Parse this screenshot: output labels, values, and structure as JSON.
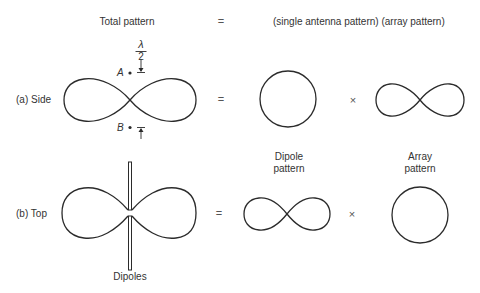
{
  "header": {
    "total_pattern": "Total pattern",
    "equals": "=",
    "rhs": "(single antenna pattern) (array pattern)"
  },
  "row_side": {
    "label": "(a) Side",
    "equals": "=",
    "times": "×",
    "annotation": {
      "lambda": "λ",
      "two": "2",
      "point_a": "A",
      "point_b": "B"
    },
    "shapes": {
      "total": "figure-eight",
      "single_antenna": "circle",
      "array": "figure-eight"
    }
  },
  "row_top": {
    "label": "(b) Top",
    "equals": "=",
    "times": "×",
    "dipole_pattern_line1": "Dipole",
    "dipole_pattern_line2": "pattern",
    "array_pattern_line1": "Array",
    "array_pattern_line2": "pattern",
    "dipoles_label": "Dipoles",
    "shapes": {
      "total": "figure-eight with dipole rods",
      "single_antenna": "figure-eight",
      "array": "circle"
    }
  },
  "colors": {
    "stroke": "#2b2b2b",
    "text": "#333333",
    "background": "#ffffff"
  }
}
